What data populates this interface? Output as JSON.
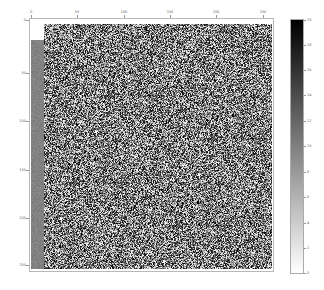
{
  "chart_data": {
    "type": "heatmap",
    "title": "",
    "xlabel": "",
    "ylabel": "",
    "colormap": "gray_r",
    "x_ticks": [
      "0",
      "50",
      "100",
      "150",
      "200",
      "250"
    ],
    "y_ticks": [
      "0",
      "50",
      "100",
      "150",
      "200",
      "250"
    ],
    "xlim": [
      0,
      256
    ],
    "ylim": [
      256,
      0
    ],
    "x_axis_position": "top",
    "colorbar": {
      "range": [
        0,
        20
      ],
      "ticks": [
        "0",
        "2",
        "4",
        "6",
        "8",
        "10",
        "12",
        "14",
        "16",
        "18",
        "20"
      ],
      "low_color": "#ffffff",
      "high_color": "#000000"
    },
    "grid": false
  },
  "axes": {
    "x_tick_positions": [
      31,
      77,
      124,
      170,
      216,
      263
    ],
    "y_tick_positions": [
      20,
      73,
      121,
      170,
      218,
      265
    ]
  },
  "colorbar_tick_positions": [
    273,
    248,
    223,
    197,
    172,
    146,
    121,
    95,
    70,
    45,
    20
  ]
}
